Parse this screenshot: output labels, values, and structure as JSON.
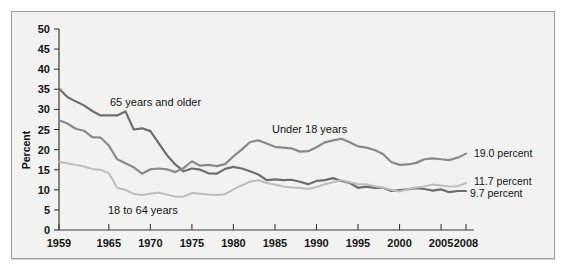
{
  "figure": {
    "title_fragment": "",
    "background": "#f2f2f1",
    "border_color": "#9a9a9a"
  },
  "axis": {
    "y_title": "Percent",
    "y_ticks": [
      "0",
      "5",
      "10",
      "15",
      "20",
      "25",
      "30",
      "35",
      "40",
      "45",
      "50"
    ],
    "x_ticks": [
      "1959",
      "1965",
      "1970",
      "1975",
      "1980",
      "1985",
      "1990",
      "1995",
      "2000",
      "2005",
      "2008"
    ]
  },
  "labels": {
    "series_65": "65 years and older",
    "series_under18": "Under 18 years",
    "series_18to64": "18 to 64 years",
    "end_under18": "19.0 percent",
    "end_18to64": "11.7 percent",
    "end_65": "9.7 percent"
  },
  "chart_data": {
    "type": "line",
    "title": "",
    "xlabel": "",
    "ylabel": "Percent",
    "xlim": [
      1959,
      2008
    ],
    "ylim": [
      0,
      50
    ],
    "ytick_step": 5,
    "grid": false,
    "legend": "inline-annotations",
    "x": [
      1959,
      1960,
      1961,
      1962,
      1963,
      1964,
      1965,
      1966,
      1967,
      1968,
      1969,
      1970,
      1971,
      1972,
      1973,
      1974,
      1975,
      1976,
      1977,
      1978,
      1979,
      1980,
      1981,
      1982,
      1983,
      1984,
      1985,
      1986,
      1987,
      1988,
      1989,
      1990,
      1991,
      1992,
      1993,
      1994,
      1995,
      1996,
      1997,
      1998,
      1999,
      2000,
      2001,
      2002,
      2003,
      2004,
      2005,
      2006,
      2007,
      2008
    ],
    "series": [
      {
        "name": "65 years and older",
        "color": "#6e6e6e",
        "end_value": 9.7,
        "end_label": "9.7 percent",
        "values": [
          35.2,
          33.1,
          32.0,
          31.0,
          29.6,
          28.5,
          28.5,
          28.5,
          29.5,
          25.0,
          25.3,
          24.6,
          21.6,
          18.6,
          16.3,
          14.6,
          15.3,
          15.0,
          14.1,
          14.0,
          15.2,
          15.7,
          15.3,
          14.6,
          13.8,
          12.4,
          12.6,
          12.4,
          12.5,
          12.0,
          11.4,
          12.2,
          12.4,
          12.9,
          12.2,
          11.7,
          10.5,
          10.8,
          10.5,
          10.5,
          9.7,
          9.9,
          10.1,
          10.4,
          10.2,
          9.8,
          10.1,
          9.4,
          9.7,
          9.7
        ]
      },
      {
        "name": "Under 18 years",
        "color": "#8a8a8a",
        "end_value": 19.0,
        "end_label": "19.0 percent",
        "values": [
          27.3,
          26.5,
          25.2,
          24.7,
          23.1,
          23.0,
          21.0,
          17.6,
          16.6,
          15.6,
          14.0,
          15.1,
          15.3,
          15.1,
          14.4,
          15.4,
          17.1,
          16.0,
          16.2,
          15.9,
          16.4,
          18.3,
          20.0,
          21.9,
          22.3,
          21.5,
          20.7,
          20.5,
          20.3,
          19.5,
          19.6,
          20.6,
          21.8,
          22.3,
          22.7,
          21.8,
          20.8,
          20.5,
          19.9,
          18.9,
          16.9,
          16.2,
          16.3,
          16.7,
          17.6,
          17.8,
          17.6,
          17.4,
          18.0,
          19.0
        ]
      },
      {
        "name": "18 to 64 years",
        "color": "#bdbdbd",
        "end_value": 11.7,
        "end_label": "11.7 percent",
        "values": [
          17.0,
          16.6,
          16.2,
          15.8,
          15.2,
          15.0,
          14.1,
          10.5,
          10.0,
          9.0,
          8.7,
          9.0,
          9.3,
          8.8,
          8.3,
          8.3,
          9.2,
          9.0,
          8.8,
          8.7,
          8.9,
          10.1,
          11.1,
          12.0,
          12.4,
          11.7,
          11.3,
          10.8,
          10.6,
          10.5,
          10.2,
          10.7,
          11.4,
          11.9,
          12.4,
          11.9,
          11.4,
          11.4,
          10.9,
          10.5,
          10.0,
          9.6,
          10.1,
          10.6,
          10.8,
          11.3,
          11.1,
          10.8,
          10.9,
          11.7
        ]
      }
    ]
  }
}
